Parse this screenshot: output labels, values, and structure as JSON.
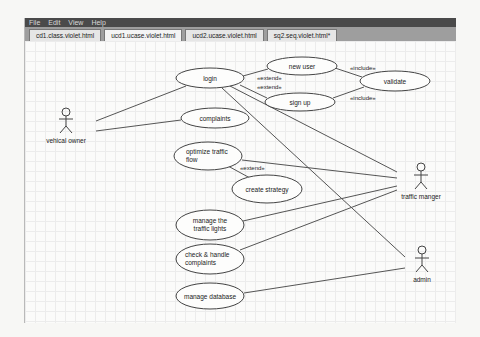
{
  "menu": [
    "File",
    "Edit",
    "View",
    "Help"
  ],
  "tabs": [
    {
      "label": "cd1.class.violet.html",
      "active": false
    },
    {
      "label": "ucd1.ucase.violet.html",
      "active": true
    },
    {
      "label": "ucd2.ucase.violet.html",
      "active": false
    },
    {
      "label": "sq2.seq.violet.html*",
      "active": false
    }
  ],
  "diagram": {
    "actors": {
      "vehicle_owner": "vehical owner",
      "traffic_manager": "traffic manger",
      "admin": "admin"
    },
    "use_cases": {
      "login": "login",
      "new_user": "new user",
      "validate": "validate",
      "sign_up": "sign up",
      "complaints": "complaints",
      "optimize_line1": "optimize traffic",
      "optimize_line2": "flow",
      "create_strategy": "create strategy",
      "manage_lights_line1": "manage the",
      "manage_lights_line2": "traffic lights",
      "check_line1": "check & handle",
      "check_line2": "complaints",
      "manage_database": "manage database"
    },
    "stereotypes": {
      "extend_new_user": "«extend»",
      "extend_sign_up": "«extend»",
      "include_new_user": "«include»",
      "include_sign_up": "«include»",
      "extend_create_strategy": "«extend»"
    }
  }
}
